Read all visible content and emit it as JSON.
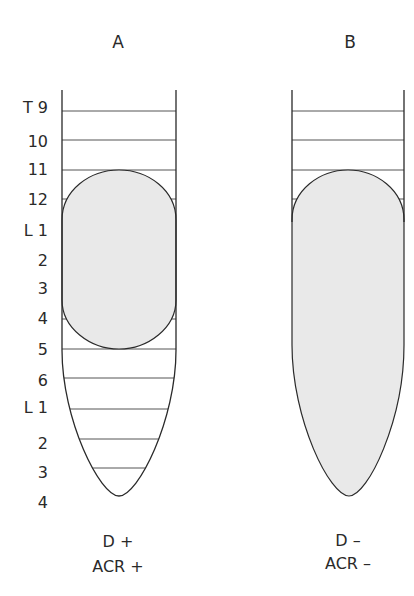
{
  "figure": {
    "panels": [
      {
        "id": "A",
        "title": "A",
        "caption_line1": "D +",
        "caption_line2": "ACR +"
      },
      {
        "id": "B",
        "title": "B",
        "caption_line1": "D –",
        "caption_line2": "ACR –"
      }
    ],
    "vertebral_levels": [
      "T 9",
      "10",
      "11",
      "12",
      "L 1",
      "2",
      "3",
      "4",
      "5",
      "6",
      "L 1",
      "2",
      "3",
      "4"
    ],
    "colors": {
      "outline": "#2a2a2a",
      "fill": "#e9e9e9",
      "grid": "#555555",
      "background": "#ffffff"
    }
  }
}
